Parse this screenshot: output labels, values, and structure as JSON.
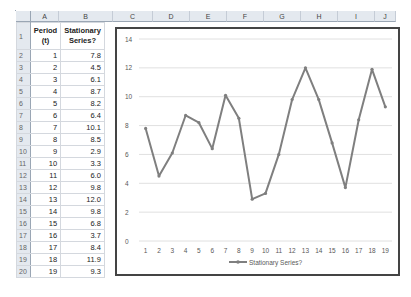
{
  "columns": [
    "A",
    "B",
    "C",
    "D",
    "E",
    "F",
    "G",
    "H",
    "I",
    "J"
  ],
  "table": {
    "headers": [
      "Period (t)",
      "Stationary Series?"
    ],
    "header_lines": {
      "a": [
        "Period",
        "(t)"
      ],
      "b": [
        "Stationary",
        "Series?"
      ]
    },
    "row_numbers": [
      "1",
      "2",
      "3",
      "4",
      "5",
      "6",
      "7",
      "8",
      "9",
      "10",
      "11",
      "12",
      "13",
      "14",
      "15",
      "16",
      "17",
      "18",
      "19",
      "20"
    ],
    "rows": [
      [
        "1",
        "7.8"
      ],
      [
        "2",
        "4.5"
      ],
      [
        "3",
        "6.1"
      ],
      [
        "4",
        "8.7"
      ],
      [
        "5",
        "8.2"
      ],
      [
        "6",
        "6.4"
      ],
      [
        "7",
        "10.1"
      ],
      [
        "8",
        "8.5"
      ],
      [
        "9",
        "2.9"
      ],
      [
        "10",
        "3.3"
      ],
      [
        "11",
        "6.0"
      ],
      [
        "12",
        "9.8"
      ],
      [
        "13",
        "12.0"
      ],
      [
        "14",
        "9.8"
      ],
      [
        "15",
        "6.8"
      ],
      [
        "16",
        "3.7"
      ],
      [
        "17",
        "8.4"
      ],
      [
        "18",
        "11.9"
      ],
      [
        "19",
        "9.3"
      ]
    ]
  },
  "chart_data": {
    "type": "line",
    "title": "",
    "xlabel": "",
    "ylabel": "",
    "categories": [
      "1",
      "2",
      "3",
      "4",
      "5",
      "6",
      "7",
      "8",
      "9",
      "10",
      "11",
      "12",
      "13",
      "14",
      "15",
      "16",
      "17",
      "18",
      "19"
    ],
    "series": [
      {
        "name": "Stationary Series?",
        "values": [
          7.8,
          4.5,
          6.1,
          8.7,
          8.2,
          6.4,
          10.1,
          8.5,
          2.9,
          3.3,
          6.0,
          9.8,
          12.0,
          9.8,
          6.8,
          3.7,
          8.4,
          11.9,
          9.3
        ],
        "color": "#7f7f7f"
      }
    ],
    "ylim": [
      0,
      14
    ],
    "yticks": [
      0,
      2,
      4,
      6,
      8,
      10,
      12,
      14
    ],
    "grid": true,
    "legend_position": "bottom"
  }
}
